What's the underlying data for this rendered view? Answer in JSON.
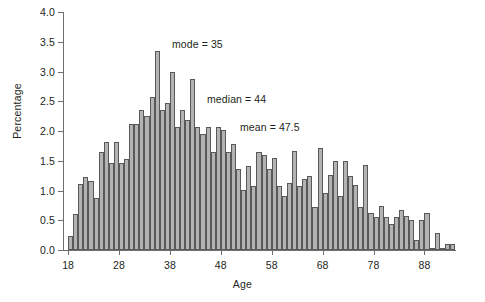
{
  "chart_data": {
    "type": "bar",
    "title": "",
    "xlabel": "Age",
    "ylabel": "Percentage",
    "xlim": [
      17,
      94
    ],
    "ylim": [
      0.0,
      4.0
    ],
    "grid": false,
    "legend": null,
    "y_ticks": [
      "0.0",
      "0.5",
      "1.0",
      "1.5",
      "2.0",
      "2.5",
      "3.0",
      "3.5",
      "4.0"
    ],
    "y_tick_values": [
      0.0,
      0.5,
      1.0,
      1.5,
      2.0,
      2.5,
      3.0,
      3.5,
      4.0
    ],
    "x_ticks": [
      "18",
      "28",
      "38",
      "48",
      "58",
      "68",
      "78",
      "88"
    ],
    "x_tick_values": [
      18,
      28,
      38,
      48,
      58,
      68,
      78,
      88
    ],
    "categories": [
      18,
      19,
      20,
      21,
      22,
      23,
      24,
      25,
      26,
      27,
      28,
      29,
      30,
      31,
      32,
      33,
      34,
      35,
      36,
      37,
      38,
      39,
      40,
      41,
      42,
      43,
      44,
      45,
      46,
      47,
      48,
      49,
      50,
      51,
      52,
      53,
      54,
      55,
      56,
      57,
      58,
      59,
      60,
      61,
      62,
      63,
      64,
      65,
      66,
      67,
      68,
      69,
      70,
      71,
      72,
      73,
      74,
      75,
      76,
      77,
      78,
      79,
      80,
      81,
      82,
      83,
      84,
      85,
      86,
      87,
      88,
      89,
      90,
      91,
      92,
      93
    ],
    "values": [
      0.23,
      0.6,
      1.11,
      1.23,
      1.16,
      0.88,
      1.64,
      1.81,
      1.46,
      1.81,
      1.46,
      1.53,
      2.11,
      2.11,
      2.35,
      2.25,
      2.58,
      3.34,
      2.35,
      2.47,
      2.99,
      2.06,
      2.35,
      2.18,
      2.88,
      2.06,
      1.95,
      2.06,
      1.65,
      2.06,
      2.02,
      1.65,
      1.78,
      1.36,
      1.01,
      1.42,
      1.08,
      1.65,
      1.6,
      1.36,
      1.54,
      1.08,
      0.9,
      1.13,
      1.66,
      1.08,
      1.2,
      1.25,
      0.73,
      1.72,
      0.96,
      1.26,
      1.49,
      0.91,
      1.5,
      1.25,
      1.1,
      0.73,
      1.43,
      0.63,
      0.55,
      0.74,
      0.56,
      0.44,
      0.55,
      0.67,
      0.58,
      0.51,
      0.17,
      0.5,
      0.63,
      0.04,
      0.28,
      0.03,
      0.1,
      0.1
    ],
    "annotations": [
      {
        "name": "mode",
        "text": "mode = 35",
        "value": 35
      },
      {
        "name": "median",
        "text": "median = 44",
        "value": 44
      },
      {
        "name": "mean",
        "text": "mean = 47.5",
        "value": 47.5
      }
    ],
    "colors": {
      "bar_fill": "#b3b3b3",
      "bar_border": "#58595b",
      "axis": "#6d6e71",
      "text": "#231f20",
      "background": "#ffffff"
    }
  }
}
